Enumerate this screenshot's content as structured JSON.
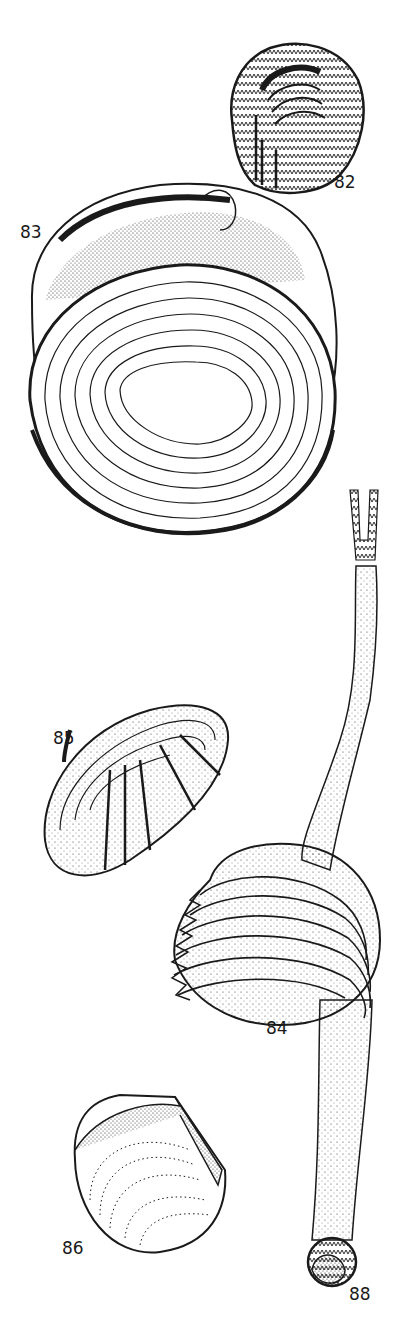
{
  "plate": {
    "background": "#ffffff",
    "ink": "#1a1a1a",
    "figures": [
      {
        "id": "82",
        "label": "82",
        "description": "small patterned bivalve shell with zigzag markings"
      },
      {
        "id": "83",
        "label": "83",
        "description": "large rounded clam shell with concentric ridges, open valve"
      },
      {
        "id": "84",
        "label": "84",
        "description": "frilled concentric-ridged clam shell with long siphon"
      },
      {
        "id": "85",
        "label": "85",
        "description": "elongated oval shell with radiating bands"
      },
      {
        "id": "86",
        "label": "86",
        "description": "rounded shell with dotted concentric growth lines"
      },
      {
        "id": "88",
        "label": "88",
        "description": "small shell at end of siphon tube"
      }
    ]
  }
}
